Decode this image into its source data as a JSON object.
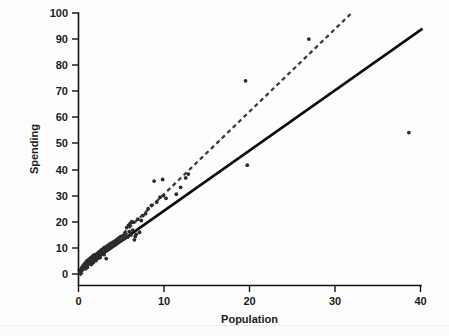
{
  "chart_data": {
    "type": "scatter",
    "title": "",
    "xlabel": "Population",
    "ylabel": "Spending",
    "xlim": [
      0,
      40
    ],
    "ylim": [
      0,
      100
    ],
    "xticks": [
      0,
      10,
      20,
      30,
      40
    ],
    "yticks": [
      0,
      10,
      20,
      30,
      40,
      50,
      60,
      70,
      80,
      90,
      100
    ],
    "xtick_labels": [
      "0",
      "10",
      "20",
      "30",
      "40"
    ],
    "ytick_labels": [
      "0",
      "10",
      "20",
      "30",
      "40",
      "50",
      "60",
      "70",
      "80",
      "90",
      "100"
    ],
    "grid": false,
    "legend": "none",
    "marker_color": "#2b2b2b",
    "series": [
      {
        "name": "observations",
        "type": "scatter",
        "points": [
          [
            0.25,
            0.4
          ],
          [
            0.3,
            1.1
          ],
          [
            0.35,
            1.6
          ],
          [
            0.4,
            2.2
          ],
          [
            0.45,
            1.3
          ],
          [
            0.5,
            2.6
          ],
          [
            0.55,
            1.9
          ],
          [
            0.6,
            3.0
          ],
          [
            0.62,
            2.3
          ],
          [
            0.68,
            3.4
          ],
          [
            0.7,
            2.0
          ],
          [
            0.75,
            3.8
          ],
          [
            0.8,
            2.9
          ],
          [
            0.85,
            4.1
          ],
          [
            0.9,
            3.2
          ],
          [
            0.95,
            4.6
          ],
          [
            1.0,
            3.5
          ],
          [
            1.05,
            5.0
          ],
          [
            1.1,
            2.7
          ],
          [
            1.15,
            4.3
          ],
          [
            1.2,
            5.4
          ],
          [
            1.25,
            3.9
          ],
          [
            1.3,
            4.8
          ],
          [
            1.35,
            5.8
          ],
          [
            1.4,
            4.2
          ],
          [
            1.45,
            6.1
          ],
          [
            1.5,
            5.2
          ],
          [
            1.55,
            3.6
          ],
          [
            1.6,
            6.5
          ],
          [
            1.65,
            4.9
          ],
          [
            1.7,
            5.6
          ],
          [
            1.75,
            6.9
          ],
          [
            1.8,
            4.4
          ],
          [
            1.85,
            6.2
          ],
          [
            1.9,
            7.3
          ],
          [
            1.95,
            5.5
          ],
          [
            2.0,
            6.8
          ],
          [
            2.1,
            5.1
          ],
          [
            2.15,
            7.6
          ],
          [
            2.2,
            6.4
          ],
          [
            2.3,
            7.9
          ],
          [
            2.35,
            6.0
          ],
          [
            2.4,
            8.3
          ],
          [
            2.5,
            7.1
          ],
          [
            2.55,
            8.7
          ],
          [
            2.6,
            6.3
          ],
          [
            2.7,
            9.0
          ],
          [
            2.75,
            7.8
          ],
          [
            2.8,
            9.4
          ],
          [
            2.9,
            8.2
          ],
          [
            3.0,
            9.8
          ],
          [
            3.05,
            7.4
          ],
          [
            3.1,
            10.2
          ],
          [
            3.2,
            8.9
          ],
          [
            3.3,
            5.9
          ],
          [
            3.35,
            10.6
          ],
          [
            3.4,
            9.3
          ],
          [
            3.5,
            11.0
          ],
          [
            3.6,
            9.7
          ],
          [
            3.7,
            11.4
          ],
          [
            3.8,
            10.1
          ],
          [
            3.9,
            11.8
          ],
          [
            4.0,
            10.5
          ],
          [
            4.1,
            12.2
          ],
          [
            4.2,
            10.9
          ],
          [
            4.3,
            12.6
          ],
          [
            4.4,
            11.3
          ],
          [
            4.5,
            13.0
          ],
          [
            4.55,
            11.7
          ],
          [
            4.6,
            13.4
          ],
          [
            4.7,
            12.1
          ],
          [
            4.8,
            13.8
          ],
          [
            4.9,
            12.5
          ],
          [
            5.0,
            14.2
          ],
          [
            5.1,
            12.9
          ],
          [
            5.2,
            14.6
          ],
          [
            5.3,
            13.3
          ],
          [
            5.4,
            15.0
          ],
          [
            5.5,
            13.7
          ],
          [
            5.6,
            15.4
          ],
          [
            5.7,
            17.8
          ],
          [
            5.8,
            14.1
          ],
          [
            5.9,
            18.6
          ],
          [
            6.0,
            16.2
          ],
          [
            6.1,
            19.4
          ],
          [
            6.2,
            14.9
          ],
          [
            6.3,
            20.1
          ],
          [
            6.4,
            16.8
          ],
          [
            6.5,
            19.8
          ],
          [
            6.6,
            13.1
          ],
          [
            6.7,
            14.4
          ],
          [
            6.8,
            15.2
          ],
          [
            7.0,
            21.0
          ],
          [
            7.2,
            16.0
          ],
          [
            7.4,
            20.5
          ],
          [
            7.6,
            22.4
          ],
          [
            7.9,
            23.1
          ],
          [
            8.2,
            25.0
          ],
          [
            8.6,
            26.3
          ],
          [
            8.9,
            35.6
          ],
          [
            9.2,
            27.5
          ],
          [
            9.6,
            29.4
          ],
          [
            9.9,
            36.2
          ],
          [
            10.0,
            30.0
          ],
          [
            10.3,
            29.0
          ],
          [
            11.5,
            30.6
          ],
          [
            12.0,
            33.2
          ],
          [
            12.6,
            36.8
          ],
          [
            12.9,
            38.3
          ],
          [
            19.6,
            74.0
          ],
          [
            19.8,
            41.7
          ],
          [
            27.0,
            90.0
          ],
          [
            38.7,
            54.2
          ]
        ]
      },
      {
        "name": "regression-line-solid",
        "type": "line",
        "style": "solid",
        "color": "#0d0d0d",
        "endpoints": [
          [
            0.0,
            1.0
          ],
          [
            40.3,
            94.0
          ]
        ],
        "slope": 2.31,
        "intercept": 1.0
      },
      {
        "name": "regression-line-dashed",
        "type": "line",
        "style": "dashed",
        "color": "#3c3c3c",
        "endpoints": [
          [
            0.2,
            -0.6
          ],
          [
            32.0,
            100.0
          ]
        ],
        "slope": 3.16,
        "intercept": -1.2
      }
    ]
  },
  "figure": {
    "background_color": "#fdfdfd",
    "axis_color": "#111111",
    "plot_left_px": 78,
    "plot_bottom_px": 285,
    "plot_right_px": 420,
    "plot_top_px": 13
  }
}
